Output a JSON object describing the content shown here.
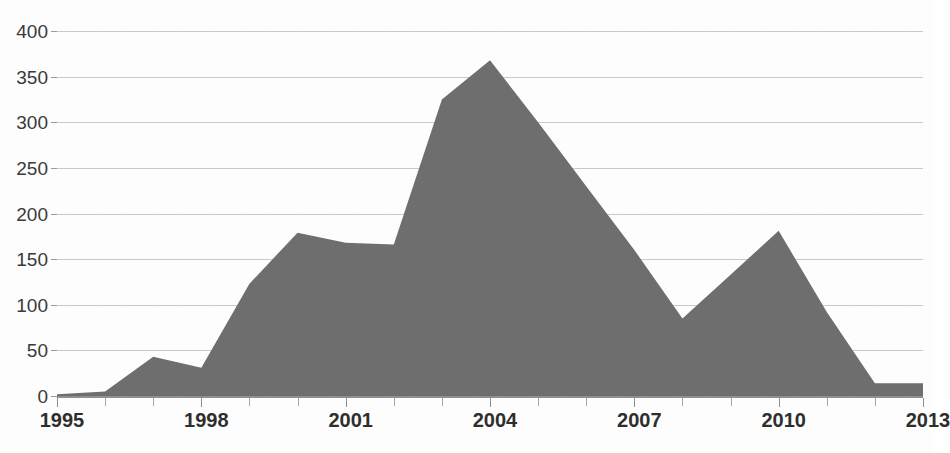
{
  "chart_data": {
    "type": "area",
    "title": "",
    "subtitle": "",
    "xlabel": "",
    "ylabel": "",
    "x": [
      1995,
      1996,
      1997,
      1998,
      1999,
      2000,
      2001,
      2002,
      2003,
      2004,
      2005,
      2006,
      2007,
      2008,
      2009,
      2010,
      2011,
      2012,
      2013
    ],
    "values": [
      2,
      5,
      43,
      31,
      123,
      179,
      168,
      166,
      325,
      368,
      300,
      230,
      160,
      85,
      133,
      181,
      92,
      14,
      14
    ],
    "series": [
      {
        "name": "",
        "values": [
          2,
          5,
          43,
          31,
          123,
          179,
          168,
          166,
          325,
          368,
          300,
          230,
          160,
          85,
          133,
          181,
          92,
          14,
          14
        ]
      }
    ],
    "xlim": [
      1995,
      2013
    ],
    "ylim": [
      0,
      400
    ],
    "x_tick_labels": [
      "1995",
      "1998",
      "2001",
      "2004",
      "2007",
      "2010",
      "2013"
    ],
    "x_tick_values": [
      1995,
      1998,
      2001,
      2004,
      2007,
      2010,
      2013
    ],
    "x_minor_tick_interval": 1,
    "y_tick_labels": [
      "400",
      "350",
      "300",
      "250",
      "200",
      "150",
      "100",
      "50",
      "0"
    ],
    "y_tick_values": [
      400,
      350,
      300,
      250,
      200,
      150,
      100,
      50,
      0
    ],
    "grid": true,
    "grid_axis": "y",
    "legend": false,
    "legend_position": "none",
    "colors": {
      "area_fill": "#6e6e6e",
      "gridline": "#c9c9c9",
      "axis_line": "#8f8f8f",
      "tick_label": "#2e2e2e",
      "y_tick_label": "#3a3a3a",
      "background": "#fdfdfd"
    }
  }
}
